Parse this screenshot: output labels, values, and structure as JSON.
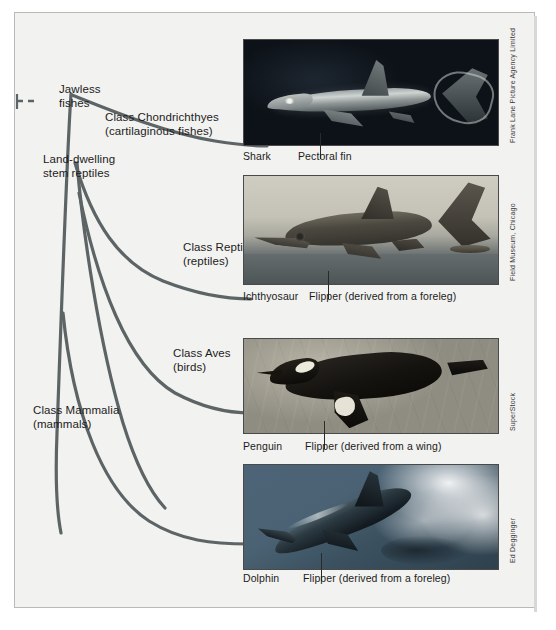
{
  "figure": {
    "background_color": "#f2f2f0",
    "line_color": "#5d6466",
    "nodes": [
      {
        "id": "jawless-fishes",
        "label_line1": "Jawless",
        "label_line2": "fishes"
      },
      {
        "id": "land-dwelling-stem-reptiles",
        "label_line1": "Land-dwelling",
        "label_line2": "stem reptiles"
      }
    ],
    "branches": [
      {
        "id": "chondrichthyes",
        "label_line1": "Class Chondrichthyes",
        "label_line2": "(cartilaginous fishes)"
      },
      {
        "id": "reptilia",
        "label_line1": "Class Reptilia",
        "label_line2": "(reptiles)"
      },
      {
        "id": "aves",
        "label_line1": "Class Aves",
        "label_line2": "(birds)"
      },
      {
        "id": "mammalia",
        "label_line1": "Class Mammalia",
        "label_line2": "(mammals)"
      }
    ]
  },
  "plates": [
    {
      "id": "shark",
      "subject_caption": "Shark",
      "structure_caption": "Pectoral fin",
      "credit": "Frank Lane Picture Agency Limited",
      "image_alt": "shark-photograph"
    },
    {
      "id": "ichthyosaur",
      "subject_caption": "Ichthyosaur",
      "structure_caption": "Flipper (derived from a foreleg)",
      "credit": "Field Museum, Chicago",
      "image_alt": "ichthyosaur-painting"
    },
    {
      "id": "penguin",
      "subject_caption": "Penguin",
      "structure_caption": "Flipper (derived from a wing)",
      "credit": "SuperStock",
      "image_alt": "penguin-photograph"
    },
    {
      "id": "dolphin",
      "subject_caption": "Dolphin",
      "structure_caption": "Flipper (derived from a foreleg)",
      "credit": "Ed Degginger",
      "image_alt": "dolphin-photograph"
    }
  ]
}
